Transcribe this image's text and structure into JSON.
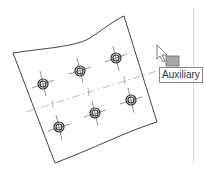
{
  "viewport": {
    "background": "#ffffff"
  },
  "part": {
    "type": "curved-plate",
    "holes_count": 6,
    "hole_color": "#333333",
    "outline_color": "#444444"
  },
  "cursor": {
    "type": "arrow-with-box"
  },
  "tooltip": {
    "text": "Auxiliary"
  },
  "colors": {
    "outline": "#444444",
    "centerline": "#bbbbbb",
    "box": "#9a9a9a"
  }
}
